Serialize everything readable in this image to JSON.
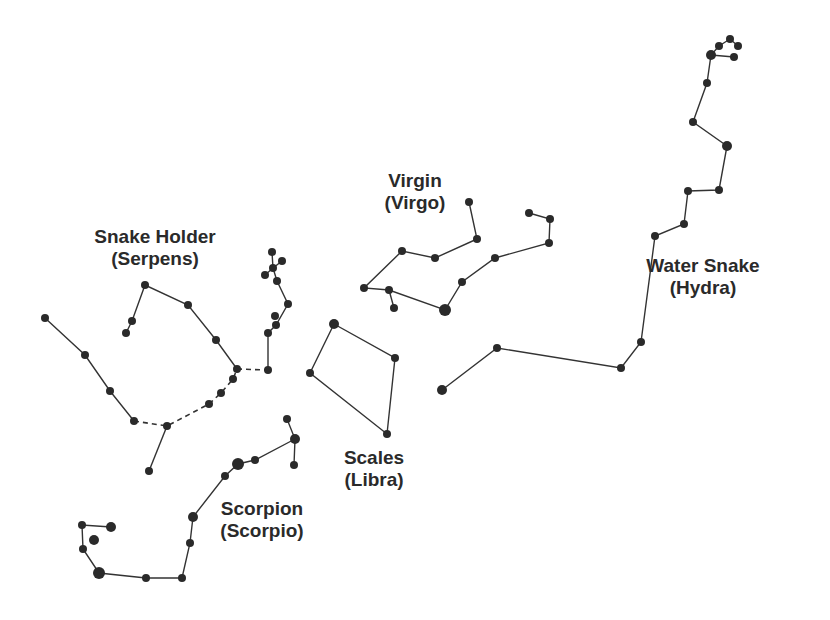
{
  "colors": {
    "background": "#ffffff",
    "ink": "#2a2a2a",
    "line": "#333333"
  },
  "constellations": [
    {
      "id": "serpens",
      "name": "Snake Holder",
      "latin": "(Serpens)",
      "label_pos": [
        155,
        226
      ],
      "stars": [
        [
          45,
          318,
          4
        ],
        [
          85,
          355,
          4
        ],
        [
          110,
          391,
          4
        ],
        [
          134,
          421,
          4
        ],
        [
          167,
          426,
          4
        ],
        [
          149,
          471,
          4
        ],
        [
          209,
          404,
          4
        ],
        [
          221,
          393,
          4
        ],
        [
          233,
          379,
          4
        ],
        [
          237,
          369,
          4
        ],
        [
          216,
          340,
          4
        ],
        [
          188,
          305,
          4
        ],
        [
          145,
          285,
          4
        ],
        [
          132,
          321,
          4
        ],
        [
          126,
          333,
          4
        ],
        [
          268,
          370,
          4
        ],
        [
          268,
          333,
          4
        ],
        [
          276,
          325,
          4
        ],
        [
          275,
          316,
          4
        ],
        [
          288,
          304,
          4
        ],
        [
          277,
          281,
          4
        ],
        [
          273,
          268,
          4
        ],
        [
          265,
          275,
          4
        ],
        [
          282,
          261,
          4
        ],
        [
          272,
          252,
          4
        ]
      ],
      "lines": [
        [
          [
            45,
            318
          ],
          [
            85,
            355
          ],
          [
            110,
            391
          ],
          [
            134,
            421
          ]
        ],
        [
          [
            167,
            426
          ],
          [
            149,
            471
          ]
        ],
        [
          [
            237,
            369
          ],
          [
            216,
            340
          ],
          [
            188,
            305
          ],
          [
            145,
            285
          ],
          [
            132,
            321
          ],
          [
            126,
            333
          ]
        ],
        [
          [
            268,
            370
          ],
          [
            268,
            333
          ],
          [
            276,
            325
          ],
          [
            288,
            304
          ],
          [
            277,
            281
          ],
          [
            273,
            268
          ],
          [
            272,
            252
          ]
        ],
        [
          [
            273,
            268
          ],
          [
            265,
            275
          ]
        ],
        [
          [
            273,
            268
          ],
          [
            282,
            261
          ]
        ]
      ],
      "dashed": [
        [
          [
            134,
            421
          ],
          [
            167,
            426
          ],
          [
            209,
            404
          ],
          [
            221,
            393
          ],
          [
            233,
            379
          ],
          [
            237,
            369
          ]
        ],
        [
          [
            237,
            369
          ],
          [
            268,
            370
          ]
        ]
      ]
    },
    {
      "id": "scorpio",
      "name": "Scorpion",
      "latin": "(Scorpio)",
      "label_pos": [
        262,
        498
      ],
      "stars": [
        [
          287,
          419,
          4
        ],
        [
          295,
          439,
          5
        ],
        [
          294,
          465,
          4
        ],
        [
          255,
          460,
          4
        ],
        [
          238,
          464,
          6
        ],
        [
          225,
          476,
          4
        ],
        [
          193,
          517,
          5
        ],
        [
          190,
          543,
          4
        ],
        [
          182,
          578,
          4
        ],
        [
          146,
          578,
          4
        ],
        [
          99,
          573,
          6
        ],
        [
          83,
          549,
          4
        ],
        [
          82,
          525,
          4
        ],
        [
          111,
          527,
          5
        ],
        [
          94,
          540,
          5
        ]
      ],
      "lines": [
        [
          [
            287,
            419
          ],
          [
            295,
            439
          ],
          [
            294,
            465
          ]
        ],
        [
          [
            295,
            439
          ],
          [
            255,
            460
          ],
          [
            238,
            464
          ],
          [
            225,
            476
          ],
          [
            193,
            517
          ],
          [
            190,
            543
          ],
          [
            182,
            578
          ],
          [
            146,
            578
          ],
          [
            99,
            573
          ],
          [
            83,
            549
          ],
          [
            82,
            525
          ],
          [
            111,
            527
          ]
        ]
      ],
      "dashed": []
    },
    {
      "id": "virgo",
      "name": "Virgin",
      "latin": "(Virgo)",
      "label_pos": [
        415,
        170
      ],
      "stars": [
        [
          469,
          202,
          4
        ],
        [
          477,
          239,
          4
        ],
        [
          435,
          258,
          4
        ],
        [
          402,
          251,
          4
        ],
        [
          364,
          288,
          4
        ],
        [
          389,
          290,
          4
        ],
        [
          394,
          308,
          4
        ],
        [
          445,
          310,
          6
        ],
        [
          462,
          282,
          4
        ],
        [
          495,
          258,
          4
        ],
        [
          549,
          243,
          4
        ],
        [
          550,
          219,
          4
        ],
        [
          529,
          213,
          4
        ]
      ],
      "lines": [
        [
          [
            469,
            202
          ],
          [
            477,
            239
          ],
          [
            435,
            258
          ],
          [
            402,
            251
          ],
          [
            364,
            288
          ],
          [
            389,
            290
          ],
          [
            445,
            310
          ],
          [
            462,
            282
          ],
          [
            495,
            258
          ],
          [
            549,
            243
          ],
          [
            550,
            219
          ],
          [
            529,
            213
          ]
        ],
        [
          [
            389,
            290
          ],
          [
            394,
            308
          ]
        ]
      ],
      "dashed": []
    },
    {
      "id": "libra",
      "name": "Scales",
      "latin": "(Libra)",
      "label_pos": [
        374,
        447
      ],
      "stars": [
        [
          334,
          324,
          5
        ],
        [
          395,
          358,
          4
        ],
        [
          387,
          434,
          4
        ],
        [
          310,
          373,
          4
        ]
      ],
      "lines": [
        [
          [
            334,
            324
          ],
          [
            395,
            358
          ],
          [
            387,
            434
          ],
          [
            310,
            373
          ],
          [
            334,
            324
          ]
        ]
      ],
      "dashed": []
    },
    {
      "id": "hydra",
      "name": "Water Snake",
      "latin": "(Hydra)",
      "label_pos": [
        703,
        255
      ],
      "stars": [
        [
          442,
          390,
          5
        ],
        [
          497,
          348,
          4
        ],
        [
          621,
          368,
          4
        ],
        [
          641,
          342,
          4
        ],
        [
          655,
          236,
          4
        ],
        [
          684,
          224,
          4
        ],
        [
          688,
          191,
          4
        ],
        [
          719,
          190,
          4
        ],
        [
          727,
          146,
          5
        ],
        [
          693,
          122,
          4
        ],
        [
          707,
          83,
          4
        ],
        [
          711,
          55,
          5
        ],
        [
          719,
          46,
          4
        ],
        [
          730,
          39,
          4
        ],
        [
          738,
          46,
          4
        ],
        [
          734,
          57,
          4
        ]
      ],
      "lines": [
        [
          [
            442,
            390
          ],
          [
            497,
            348
          ],
          [
            621,
            368
          ],
          [
            641,
            342
          ],
          [
            655,
            236
          ],
          [
            684,
            224
          ],
          [
            688,
            191
          ],
          [
            719,
            190
          ],
          [
            727,
            146
          ],
          [
            693,
            122
          ],
          [
            707,
            83
          ],
          [
            711,
            55
          ],
          [
            719,
            46
          ],
          [
            730,
            39
          ],
          [
            738,
            46
          ]
        ],
        [
          [
            711,
            55
          ],
          [
            734,
            57
          ]
        ]
      ],
      "dashed": []
    }
  ]
}
